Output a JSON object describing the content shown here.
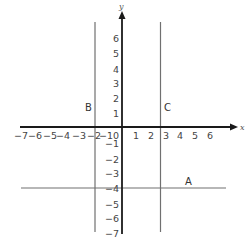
{
  "diagram": {
    "type": "coordinate-plane",
    "axes": {
      "x_label": "x",
      "y_label": "y",
      "x_ticks": [
        "−7",
        "−6",
        "−5",
        "−4",
        "−3",
        "−2",
        "−1",
        "0",
        "1",
        "2",
        "3",
        "4",
        "5",
        "6"
      ],
      "y_ticks_positive": [
        "6",
        "5",
        "4",
        "3",
        "2",
        "1"
      ],
      "y_ticks_negative": [
        "−1",
        "−2",
        "−3",
        "−4",
        "−5",
        "−6",
        "−7"
      ]
    },
    "lines": [
      {
        "name": "A",
        "label": "A",
        "orientation": "horizontal",
        "equation": "y = -4"
      },
      {
        "name": "B",
        "label": "B",
        "orientation": "vertical",
        "equation": "x = -2"
      },
      {
        "name": "C",
        "label": "C",
        "orientation": "vertical",
        "equation": "x = 3"
      }
    ],
    "colors": {
      "axis": "#1a1a1a",
      "line": "#707070",
      "text": "#444444"
    }
  }
}
